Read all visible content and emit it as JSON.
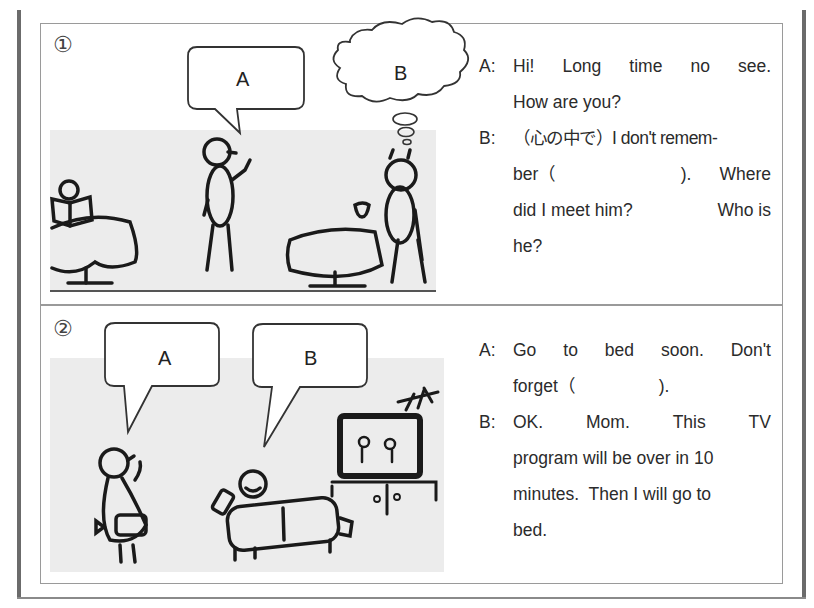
{
  "panels": [
    {
      "number": "①",
      "bubbles": {
        "a": "A",
        "b": "B"
      },
      "dialog": [
        {
          "speaker": "A:",
          "words": [
            "Hi!",
            "Long",
            "time",
            "no",
            "see."
          ],
          "justify": true
        },
        {
          "speaker": "",
          "words": [
            "How are you?"
          ],
          "justify": false
        },
        {
          "speaker": "B:",
          "words": [
            "（心の中で）I don't remem-"
          ],
          "justify": false
        },
        {
          "speaker": "",
          "words": [
            "ber（",
            ").",
            "Where"
          ],
          "justify": true
        },
        {
          "speaker": "",
          "words": [
            "did I meet him?",
            "Who is"
          ],
          "justify": true
        },
        {
          "speaker": "",
          "words": [
            "he?"
          ],
          "justify": false
        }
      ]
    },
    {
      "number": "②",
      "bubbles": {
        "a": "A",
        "b": "B"
      },
      "dialog": [
        {
          "speaker": "A:",
          "words": [
            "Go",
            "to",
            "bed",
            "soon.",
            "Don't"
          ],
          "justify": true
        },
        {
          "speaker": "",
          "words": [
            "forget（",
            ")."
          ],
          "justify": false
        },
        {
          "speaker": "B:",
          "words": [
            "OK.",
            "Mom.",
            "This",
            "TV"
          ],
          "justify": true
        },
        {
          "speaker": "",
          "words": [
            "program will be over in 10"
          ],
          "justify": false
        },
        {
          "speaker": "",
          "words": [
            "minutes.  Then I will go to"
          ],
          "justify": false
        },
        {
          "speaker": "",
          "words": [
            "bed."
          ],
          "justify": false
        }
      ]
    }
  ]
}
